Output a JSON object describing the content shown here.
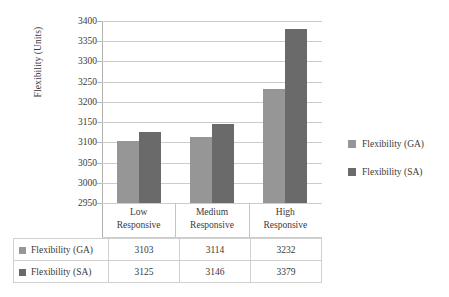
{
  "chart_data": {
    "type": "bar",
    "title": "",
    "xlabel": "",
    "ylabel": "Flexibility (Units)",
    "ylim": [
      2950,
      3400
    ],
    "ytick_step": 50,
    "yticks": [
      3400,
      3350,
      3300,
      3250,
      3200,
      3150,
      3100,
      3050,
      3000,
      2950
    ],
    "ytick_labels": [
      "3400",
      "3350",
      "3300",
      "3250",
      "3200",
      "3150",
      "3100",
      "3050",
      "3000",
      "2950"
    ],
    "categories": [
      "Low Responsive",
      "Medium Responsive",
      "High Responsive"
    ],
    "category_lines": [
      [
        "Low",
        "Responsive"
      ],
      [
        "Medium",
        "Responsive"
      ],
      [
        "High",
        "Responsive"
      ]
    ],
    "grid": true,
    "legend_position": "right",
    "series": [
      {
        "name": "Flexibility (GA)",
        "color": "#969696",
        "values": [
          3103,
          3114,
          3232
        ],
        "value_labels": [
          "3103",
          "3114",
          "3232"
        ]
      },
      {
        "name": "Flexibility (SA)",
        "color": "#6a6a6a",
        "values": [
          3125,
          3146,
          3379
        ],
        "value_labels": [
          "3125",
          "3146",
          "3379"
        ]
      }
    ]
  },
  "legend": {
    "items": [
      {
        "label": "Flexibility (GA)",
        "color": "#969696"
      },
      {
        "label": "Flexibility (SA)",
        "color": "#6a6a6a"
      }
    ]
  },
  "data_table": {
    "corner_label": "",
    "column_headers": [
      "Low Responsive",
      "Medium Responsive",
      "High Responsive"
    ],
    "rows": [
      {
        "label": "Flexibility (GA)",
        "color": "#969696",
        "cells": [
          "3103",
          "3114",
          "3232"
        ]
      },
      {
        "label": "Flexibility (SA)",
        "color": "#6a6a6a",
        "cells": [
          "3125",
          "3146",
          "3379"
        ]
      }
    ]
  }
}
